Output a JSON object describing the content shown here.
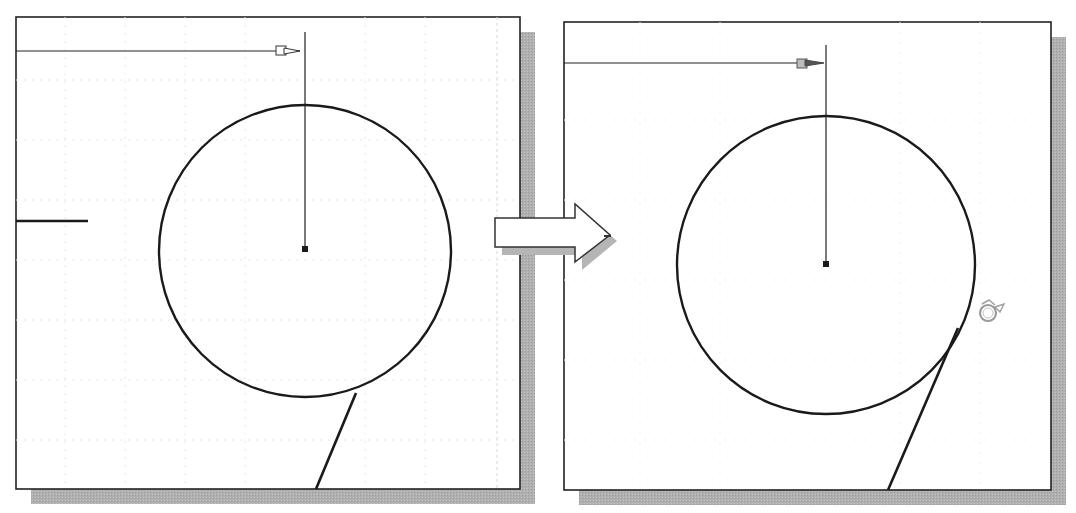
{
  "figure": {
    "colors": {
      "background": "#ffffff",
      "stroke": "#1a1a1a",
      "shadow": "#a8a8a8",
      "grid": "#e4e4e4",
      "cursor": "#9a9a9a"
    }
  },
  "left_panel": {
    "label": "before",
    "box": {
      "x": 16,
      "y": 17,
      "w": 504,
      "h": 472
    },
    "circle": {
      "cx": 305,
      "cy": 249,
      "r": 146
    },
    "center_point": {
      "x": 305,
      "y": 249
    },
    "dimension": {
      "y": 51,
      "x_start": 16,
      "x_end": 305,
      "vertical_top": 32
    },
    "short_line": {
      "x1": 16,
      "y1": 221,
      "x2": 88,
      "y2": 221
    },
    "angled_line": {
      "x1": 356,
      "y1": 393,
      "x2": 316,
      "y2": 489
    }
  },
  "right_panel": {
    "label": "after",
    "box": {
      "x": 564,
      "y": 22,
      "w": 487,
      "h": 468
    },
    "circle": {
      "cx": 826,
      "cy": 264,
      "r": 149
    },
    "center_point": {
      "x": 826,
      "y": 264
    },
    "dimension": {
      "y": 63,
      "x_start": 564,
      "x_end": 826,
      "vertical_top": 45
    },
    "tangent_line": {
      "x1": 958,
      "y1": 330,
      "x2": 888,
      "y2": 490
    },
    "cursor": {
      "name": "tangent-snap-cursor",
      "x": 988,
      "y": 313
    }
  },
  "transition_arrow": {
    "direction": "right",
    "meaning": "before-to-after"
  }
}
